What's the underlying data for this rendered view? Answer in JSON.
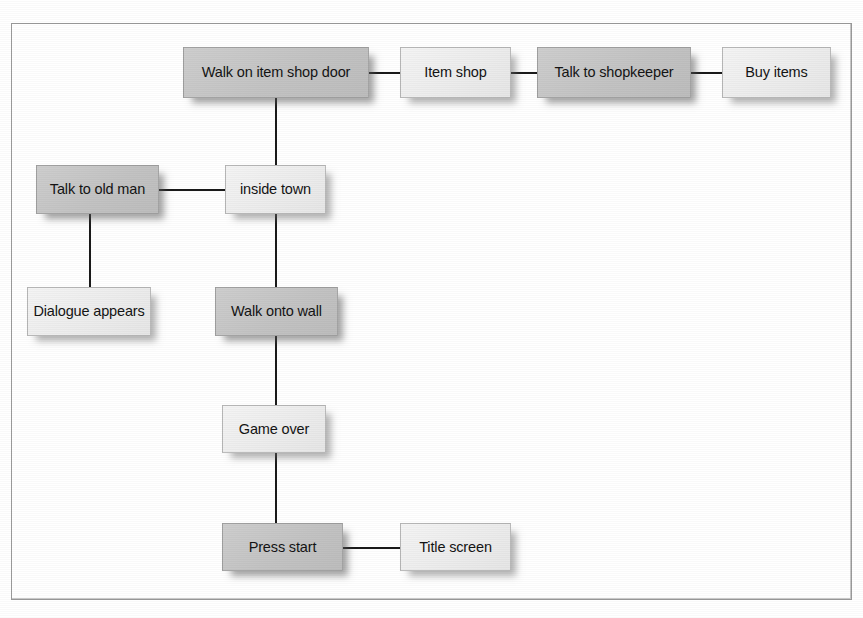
{
  "diagram": {
    "frame": {
      "border_color": "#9a9a9a"
    },
    "palette": {
      "node_dark": "#c6c6c6",
      "node_light": "#efefef",
      "text": "#141414",
      "connector": "#1a1a1a",
      "page_background": "#ffffff"
    },
    "nodes": [
      {
        "id": "walk-on-item-shop-door",
        "label": "Walk on item shop door",
        "shade": "dark",
        "x": 183,
        "y": 47,
        "w": 186,
        "h": 51
      },
      {
        "id": "item-shop",
        "label": "Item shop",
        "shade": "light",
        "x": 400,
        "y": 47,
        "w": 111,
        "h": 51
      },
      {
        "id": "talk-to-shopkeeper",
        "label": "Talk to shopkeeper",
        "shade": "dark",
        "x": 537,
        "y": 47,
        "w": 154,
        "h": 51
      },
      {
        "id": "buy-items",
        "label": "Buy items",
        "shade": "light",
        "x": 722,
        "y": 47,
        "w": 109,
        "h": 51
      },
      {
        "id": "talk-to-old-man",
        "label": "Talk to old man",
        "shade": "dark",
        "x": 36,
        "y": 165,
        "w": 123,
        "h": 49
      },
      {
        "id": "inside-town",
        "label": "inside town",
        "shade": "light",
        "x": 225,
        "y": 165,
        "w": 101,
        "h": 49
      },
      {
        "id": "dialogue-appears",
        "label": "Dialogue appears",
        "shade": "light",
        "x": 27,
        "y": 287,
        "w": 124,
        "h": 49
      },
      {
        "id": "walk-onto-wall",
        "label": "Walk onto wall",
        "shade": "dark",
        "x": 215,
        "y": 287,
        "w": 123,
        "h": 49
      },
      {
        "id": "game-over",
        "label": "Game over",
        "shade": "light",
        "x": 222,
        "y": 405,
        "w": 104,
        "h": 48
      },
      {
        "id": "press-start",
        "label": "Press start",
        "shade": "dark",
        "x": 222,
        "y": 523,
        "w": 121,
        "h": 48
      },
      {
        "id": "title-screen",
        "label": "Title screen",
        "shade": "light",
        "x": 400,
        "y": 523,
        "w": 111,
        "h": 48
      }
    ],
    "connectors": [
      {
        "id": "walk-on-item-shop-door--item-shop",
        "from": "walk-on-item-shop-door",
        "to": "item-shop",
        "orient": "h",
        "x": 369,
        "y": 72,
        "length": 32
      },
      {
        "id": "item-shop--talk-to-shopkeeper",
        "from": "item-shop",
        "to": "talk-to-shopkeeper",
        "orient": "h",
        "x": 511,
        "y": 72,
        "length": 27
      },
      {
        "id": "talk-to-shopkeeper--buy-items",
        "from": "talk-to-shopkeeper",
        "to": "buy-items",
        "orient": "h",
        "x": 691,
        "y": 72,
        "length": 32
      },
      {
        "id": "walk-on-item-shop-door--inside-town",
        "from": "walk-on-item-shop-door",
        "to": "inside-town",
        "orient": "v",
        "x": 275,
        "y": 98,
        "length": 68
      },
      {
        "id": "talk-to-old-man--inside-town",
        "from": "talk-to-old-man",
        "to": "inside-town",
        "orient": "h",
        "x": 159,
        "y": 189,
        "length": 67
      },
      {
        "id": "talk-to-old-man--dialogue-appears",
        "from": "talk-to-old-man",
        "to": "dialogue-appears",
        "orient": "v",
        "x": 89,
        "y": 214,
        "length": 74
      },
      {
        "id": "inside-town--walk-onto-wall",
        "from": "inside-town",
        "to": "walk-onto-wall",
        "orient": "v",
        "x": 275,
        "y": 214,
        "length": 74
      },
      {
        "id": "walk-onto-wall--game-over",
        "from": "walk-onto-wall",
        "to": "game-over",
        "orient": "v",
        "x": 275,
        "y": 336,
        "length": 70
      },
      {
        "id": "game-over--press-start",
        "from": "game-over",
        "to": "press-start",
        "orient": "v",
        "x": 275,
        "y": 453,
        "length": 71
      },
      {
        "id": "press-start--title-screen",
        "from": "press-start",
        "to": "title-screen",
        "orient": "h",
        "x": 343,
        "y": 547,
        "length": 58
      }
    ]
  }
}
